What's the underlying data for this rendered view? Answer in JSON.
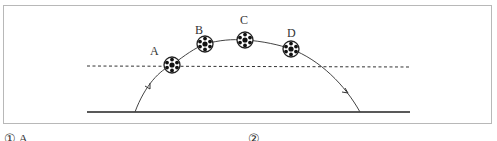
{
  "diagram": {
    "points": [
      {
        "label": "A",
        "x": 172,
        "y": 65
      },
      {
        "label": "B",
        "x": 205,
        "y": 44
      },
      {
        "label": "C",
        "x": 245,
        "y": 40
      },
      {
        "label": "D",
        "x": 291,
        "y": 49
      }
    ],
    "ground_line": {
      "x1": 87,
      "x2": 410,
      "y": 112
    },
    "reference_line": {
      "style": "dashed",
      "x1": 87,
      "x2": 410,
      "y": 66
    },
    "trajectory": {
      "start_x": 135,
      "end_x": 360,
      "direction_arrows": 2
    }
  },
  "options": [
    {
      "marker": "①",
      "label": "A"
    },
    {
      "marker": "②",
      "label": ""
    }
  ]
}
